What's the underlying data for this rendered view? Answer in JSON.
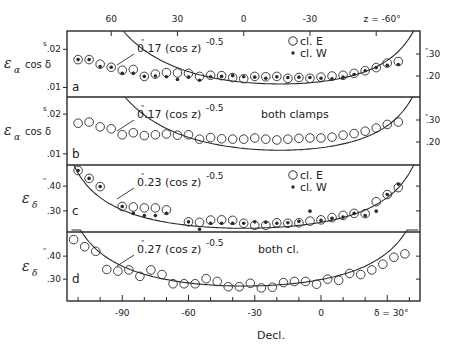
{
  "chart_data": [
    {
      "panel": "a",
      "type": "scatter",
      "ylabel": "εα cos δ",
      "ylabel_main": "ε",
      "ylabel_sub": "α",
      "ylabel_rest": "cos δ",
      "yunit_mark": "s",
      "left_ticks": [
        ".02",
        ".01"
      ],
      "left_tick_values": [
        0.02,
        0.01
      ],
      "right_ticks": [
        ".30",
        ".20"
      ],
      "right_tick_values": [
        0.3,
        0.2
      ],
      "right_unit_mark": "\"",
      "ylim": [
        0.0075,
        0.0248
      ],
      "fit_label": "0.17 (cos z)",
      "fit_label_prefix": "0",
      "fit_label_body": ".17 (cos z)",
      "fit_exponent": "-0.5",
      "fit_coef": 0.0072,
      "fit_type": "ra",
      "legend": [
        {
          "marker": "open-circle",
          "label": "cl. E"
        },
        {
          "marker": "filled-dot",
          "label": "cl. W"
        }
      ],
      "legend_position": "top-right",
      "series": [
        {
          "name": "cl. E",
          "marker": "open-circle",
          "x": [
            -110,
            -105,
            -100,
            -95,
            -90,
            -85,
            -80,
            -75,
            -70,
            -65,
            -60,
            -55,
            -50,
            -45,
            -40,
            -35,
            -30,
            -25,
            -20,
            -15,
            -10,
            -5,
            0,
            5,
            10,
            15,
            20,
            25,
            30,
            35
          ],
          "values": [
            0.0173,
            0.0173,
            0.0161,
            0.0153,
            0.0145,
            0.0147,
            0.0129,
            0.0135,
            0.0139,
            0.0138,
            0.0137,
            0.0129,
            0.0132,
            0.0131,
            0.0126,
            0.0123,
            0.0129,
            0.0128,
            0.0129,
            0.0124,
            0.0126,
            0.0124,
            0.0127,
            0.013,
            0.0132,
            0.0137,
            0.0144,
            0.0152,
            0.0164,
            0.0168
          ]
        },
        {
          "name": "cl. W",
          "marker": "filled-dot",
          "x": [
            -110,
            -105,
            -100,
            -95,
            -90,
            -85,
            -80,
            -75,
            -70,
            -65,
            -60,
            -55,
            -50,
            -45,
            -40,
            -35,
            -30,
            -25,
            -20,
            -15,
            -10,
            -5,
            0,
            5,
            10,
            15,
            20,
            25,
            30,
            35
          ],
          "values": [
            0.0173,
            0.0173,
            0.0155,
            0.0153,
            0.0137,
            0.0137,
            0.0129,
            0.013,
            0.0128,
            0.0121,
            0.0127,
            0.0119,
            0.0128,
            0.0129,
            0.0131,
            0.0128,
            0.0127,
            0.0124,
            0.0128,
            0.0126,
            0.0127,
            0.0126,
            0.0124,
            0.0123,
            0.0127,
            0.0134,
            0.0144,
            0.0152,
            0.0158,
            0.016
          ]
        }
      ]
    },
    {
      "panel": "b",
      "type": "scatter",
      "ylabel": "εα cos δ",
      "ylabel_main": "ε",
      "ylabel_sub": "α",
      "ylabel_rest": "cos δ",
      "yunit_mark": "s",
      "left_ticks": [
        ".02",
        ".01"
      ],
      "left_tick_values": [
        0.02,
        0.01
      ],
      "right_ticks": [
        ".30",
        ".20"
      ],
      "right_tick_values": [
        0.3,
        0.2
      ],
      "right_unit_mark": "\"",
      "ylim": [
        0.0072,
        0.0243
      ],
      "fit_label": "0.17 (cos z)",
      "fit_label_prefix": "0",
      "fit_label_body": ".17 (cos z)",
      "fit_exponent": "-0.5",
      "fit_coef": 0.0072,
      "fit_type": "ra",
      "legend": [
        {
          "marker": "text",
          "label": "both clamps"
        }
      ],
      "legend_position": "top-center",
      "series": [
        {
          "name": "both clamps",
          "marker": "open-circle",
          "x": [
            -110,
            -105,
            -100,
            -95,
            -90,
            -85,
            -80,
            -75,
            -70,
            -65,
            -60,
            -55,
            -50,
            -45,
            -40,
            -35,
            -30,
            -25,
            -20,
            -15,
            -10,
            -5,
            0,
            5,
            10,
            15,
            20,
            25,
            30,
            35
          ],
          "values": [
            0.0177,
            0.018,
            0.0168,
            0.0163,
            0.0148,
            0.0153,
            0.0146,
            0.0148,
            0.015,
            0.0147,
            0.0148,
            0.0137,
            0.0141,
            0.0138,
            0.0137,
            0.0137,
            0.014,
            0.0137,
            0.0135,
            0.0137,
            0.0139,
            0.014,
            0.014,
            0.0142,
            0.0147,
            0.0151,
            0.0157,
            0.0165,
            0.0174,
            0.018
          ]
        }
      ]
    },
    {
      "panel": "c",
      "type": "scatter",
      "ylabel": "εδ",
      "ylabel_main": "ε",
      "ylabel_sub": "δ",
      "ylabel_rest": "",
      "yunit_mark": "\"",
      "left_ticks": [
        ".40",
        ".30"
      ],
      "left_tick_values": [
        0.4,
        0.3
      ],
      "right_ticks": [],
      "right_tick_values": [],
      "ylim": [
        0.215,
        0.485
      ],
      "fit_label": "0.23 (cos z)",
      "fit_label_prefix": "0",
      "fit_label_body": ".23 (cos z)",
      "fit_exponent": "-0.5",
      "fit_coef": 0.23,
      "fit_type": "dec",
      "legend": [
        {
          "marker": "open-circle",
          "label": "cl. E"
        },
        {
          "marker": "filled-dot",
          "label": "cl. W"
        }
      ],
      "legend_position": "top-right",
      "series": [
        {
          "name": "cl. E",
          "marker": "open-circle",
          "x": [
            -110,
            -105,
            -100,
            -90,
            -85,
            -80,
            -75,
            -70,
            -60,
            -55,
            -50,
            -45,
            -40,
            -35,
            -30,
            -25,
            -20,
            -15,
            -10,
            -5,
            0,
            5,
            10,
            15,
            20,
            25,
            30,
            35
          ],
          "values": [
            0.463,
            0.431,
            0.398,
            0.318,
            0.316,
            0.312,
            0.312,
            0.304,
            0.256,
            0.254,
            0.263,
            0.264,
            0.262,
            0.25,
            0.242,
            0.242,
            0.252,
            0.25,
            0.252,
            0.259,
            0.264,
            0.273,
            0.282,
            0.29,
            0.289,
            0.337,
            0.366,
            0.394
          ]
        },
        {
          "name": "cl. W",
          "marker": "filled-dot",
          "x": [
            -110,
            -105,
            -100,
            -90,
            -85,
            -80,
            -75,
            -70,
            -60,
            -55,
            -50,
            -45,
            -40,
            -35,
            -30,
            -25,
            -20,
            -15,
            -10,
            -5,
            0,
            5,
            10,
            15,
            20,
            25,
            30,
            35
          ],
          "values": [
            0.463,
            0.431,
            0.398,
            0.318,
            0.29,
            0.281,
            0.281,
            0.29,
            0.256,
            0.226,
            0.25,
            0.25,
            0.25,
            0.25,
            0.256,
            0.254,
            0.25,
            0.252,
            0.258,
            0.299,
            0.262,
            0.27,
            0.275,
            0.29,
            0.281,
            0.299,
            0.366,
            0.408
          ]
        }
      ]
    },
    {
      "panel": "d",
      "type": "scatter",
      "ylabel": "εδ",
      "ylabel_main": "ε",
      "ylabel_sub": "δ",
      "ylabel_rest": "",
      "yunit_mark": "\"",
      "left_ticks": [
        ".40",
        ".30"
      ],
      "left_tick_values": [
        0.4,
        0.3
      ],
      "right_ticks": [],
      "right_tick_values": [],
      "ylim": [
        0.205,
        0.505
      ],
      "fit_label": "0.27 (cos z)",
      "fit_label_prefix": "0",
      "fit_label_body": ".27 (cos z)",
      "fit_exponent": "-0.5",
      "fit_coef": 0.27,
      "fit_type": "dec",
      "legend": [
        {
          "marker": "text",
          "label": "both cl."
        }
      ],
      "legend_position": "top-right",
      "series": [
        {
          "name": "both cl.",
          "marker": "open-circle",
          "x": [
            -112,
            -107,
            -102,
            -97,
            -92,
            -87,
            -82,
            -77,
            -72,
            -67,
            -62,
            -57,
            -52,
            -47,
            -42,
            -37,
            -32,
            -27,
            -22,
            -17,
            -12,
            -7,
            -2,
            3,
            8,
            13,
            18,
            23,
            28,
            33,
            38
          ],
          "values": [
            0.472,
            0.441,
            0.421,
            0.342,
            0.335,
            0.34,
            0.312,
            0.34,
            0.32,
            0.28,
            0.28,
            0.28,
            0.302,
            0.29,
            0.267,
            0.267,
            0.282,
            0.262,
            0.265,
            0.285,
            0.29,
            0.29,
            0.278,
            0.3,
            0.295,
            0.325,
            0.32,
            0.34,
            0.365,
            0.395,
            0.41
          ]
        }
      ]
    }
  ],
  "axes": {
    "top_label_ticks": [
      "60",
      "30",
      "0",
      "-30",
      "z = -60°"
    ],
    "top_tick_values_z": [
      60,
      30,
      0,
      -30,
      -60
    ],
    "bottom_label_ticks": [
      "-90",
      "-60",
      "-30",
      "0",
      "δ = 30°"
    ],
    "bottom_tick_values": [
      -90,
      -60,
      -30,
      0,
      30
    ],
    "xlabel": "Decl.",
    "xlim": [
      -115,
      45
    ],
    "latitude_offset": -35
  }
}
